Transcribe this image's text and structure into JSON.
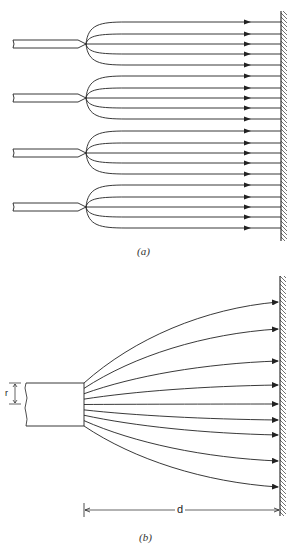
{
  "figure": {
    "part_a": {
      "label": "(a)",
      "nozzle_count": 4,
      "nozzle_centers_y": [
        44,
        98,
        153,
        207
      ],
      "streamline_offsets": [
        -22,
        -10,
        0,
        10,
        21
      ],
      "arrow_x": 248,
      "wall_x": 281
    },
    "part_b": {
      "label": "(b)",
      "radius_label": "r",
      "distance_label": "d",
      "nozzle": {
        "x": 26,
        "y": 383,
        "w": 58,
        "h": 43
      },
      "wall_x": 280,
      "streamline_end_y": [
        302,
        329,
        361,
        385,
        404,
        420,
        435,
        461,
        487
      ]
    },
    "colors": {
      "line": "#222222",
      "background": "#ffffff"
    }
  }
}
